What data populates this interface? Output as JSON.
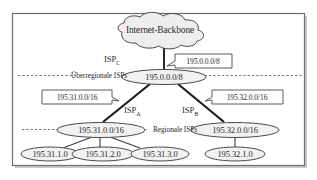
{
  "figure": {
    "frame": {
      "border_color": "#6e6e6e",
      "background": "#ffffff",
      "shadow_color": "#c9c9c9"
    },
    "style": {
      "node_fill": "#f2f2f2",
      "node_stroke": "#4a4a4a",
      "cloud_fill": "#eeeeee",
      "link_color": "#1c1c1c",
      "dash_color": "#6a6a6a",
      "text_color": "#2a2a2a"
    }
  },
  "backbone": {
    "label": "Internet-Backbone"
  },
  "tiers": [
    {
      "id": "tier-national",
      "label": "Überregionale ISPs"
    },
    {
      "id": "tier-regional",
      "label": "Regionale ISPs"
    }
  ],
  "isp_labels": [
    {
      "id": "isp-c",
      "name": "ISP",
      "subscript": "C"
    },
    {
      "id": "isp-a",
      "name": "ISP",
      "subscript": "A"
    },
    {
      "id": "isp-b",
      "name": "ISP",
      "subscript": "B"
    }
  ],
  "nodes": {
    "national": {
      "id": "node-national",
      "label": "195.0.0.0/8"
    },
    "regional_left": {
      "id": "node-regional-left",
      "label": "195.31.0.0/16"
    },
    "regional_right": {
      "id": "node-regional-right",
      "label": "195.32.0.0/16"
    },
    "leaves": [
      {
        "id": "leaf-195-31-1-0",
        "label": "195.31.1.0"
      },
      {
        "id": "leaf-195-31-2-0",
        "label": "195.31.2.0"
      },
      {
        "id": "leaf-195-31-3-0",
        "label": "195.31.3.0"
      },
      {
        "id": "leaf-195-32-1-0",
        "label": "195.32.1.0"
      }
    ]
  },
  "callouts": [
    {
      "id": "callout-backbone-prefix",
      "label": "195.0.0.0/8"
    },
    {
      "id": "callout-left-prefix",
      "label": "195.31.0.0/16"
    },
    {
      "id": "callout-right-prefix",
      "label": "195.32.0.0/16"
    }
  ]
}
